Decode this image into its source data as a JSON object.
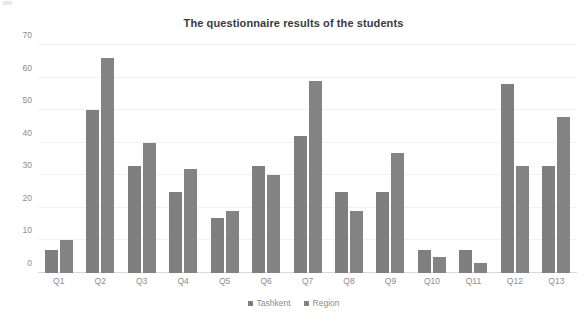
{
  "chart_data": {
    "type": "bar",
    "title": "The questionnaire results of the students",
    "xlabel": "",
    "ylabel": "",
    "ylim": [
      0,
      70
    ],
    "yticks": [
      0,
      10,
      20,
      30,
      40,
      50,
      60,
      70
    ],
    "grid": true,
    "legend_position": "bottom",
    "categories": [
      "Q1",
      "Q2",
      "Q3",
      "Q4",
      "Q5",
      "Q6",
      "Q7",
      "Q8",
      "Q9",
      "Q10",
      "Q11",
      "Q12",
      "Q13"
    ],
    "series": [
      {
        "name": "Tashkent",
        "color": "#7f7f7f",
        "values": [
          7,
          50,
          33,
          25,
          17,
          33,
          42,
          25,
          25,
          7,
          7,
          58,
          33
        ]
      },
      {
        "name": "Region",
        "color": "#838383",
        "values": [
          10,
          66,
          40,
          32,
          19,
          30,
          59,
          19,
          37,
          5,
          3,
          33,
          48
        ]
      }
    ]
  }
}
